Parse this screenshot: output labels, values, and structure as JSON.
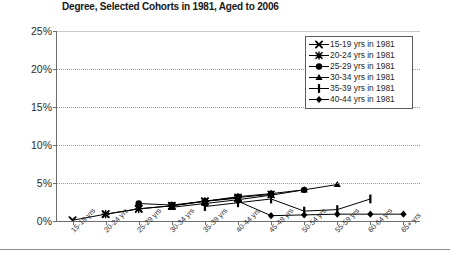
{
  "chart_data": {
    "type": "line",
    "title": "Degree, Selected Cohorts in 1981, Aged to 2006",
    "xlabel": "",
    "ylabel": "",
    "ylim": [
      0,
      25
    ],
    "yticks": [
      0,
      5,
      10,
      15,
      20,
      25
    ],
    "ytick_labels": [
      "0%",
      "5%",
      "10%",
      "15%",
      "20%",
      "25%"
    ],
    "grid": true,
    "legend_position": "top-right",
    "categories": [
      "15-19 yrs",
      "20-24 yrs",
      "25-29 yrs",
      "30-34 yrs",
      "35-39 yrs",
      "40-44 yrs",
      "45-49 yrs",
      "50-54 yrs",
      "55-59 yrs",
      "60-64 yrs",
      "65+ yrs"
    ],
    "series": [
      {
        "name": "15-19 yrs in 1981",
        "marker": "x",
        "color": "#000000",
        "x": [
          "15-19 yrs",
          "20-24 yrs",
          "25-29 yrs",
          "30-34 yrs",
          "35-39 yrs",
          "40-44 yrs"
        ],
        "values": [
          0.1,
          0.9,
          1.6,
          2.0,
          2.6,
          3.0
        ]
      },
      {
        "name": "20-24 yrs in 1981",
        "marker": "asterisk",
        "color": "#000000",
        "x": [
          "20-24 yrs",
          "25-29 yrs",
          "30-34 yrs",
          "35-39 yrs",
          "40-44 yrs",
          "45-49 yrs"
        ],
        "values": [
          0.9,
          1.6,
          2.0,
          2.6,
          3.1,
          3.5
        ]
      },
      {
        "name": "25-29 yrs in 1981",
        "marker": "circle",
        "color": "#000000",
        "x": [
          "25-29 yrs",
          "30-34 yrs",
          "35-39 yrs",
          "40-44 yrs",
          "45-49 yrs",
          "50-54 yrs"
        ],
        "values": [
          2.3,
          2.1,
          2.6,
          3.2,
          3.6,
          4.1
        ]
      },
      {
        "name": "30-34 yrs in 1981",
        "marker": "triangle",
        "color": "#000000",
        "x": [
          "30-34 yrs",
          "35-39 yrs",
          "40-44 yrs",
          "45-49 yrs",
          "50-54 yrs",
          "55-59 yrs"
        ],
        "values": [
          1.8,
          2.3,
          2.8,
          3.4,
          4.1,
          4.8
        ]
      },
      {
        "name": "35-39 yrs in 1981",
        "marker": "bar",
        "color": "#000000",
        "x": [
          "35-39 yrs",
          "40-44 yrs",
          "45-49 yrs",
          "50-54 yrs",
          "55-59 yrs",
          "60-64 yrs"
        ],
        "values": [
          1.9,
          2.4,
          2.9,
          1.3,
          1.5,
          2.9
        ]
      },
      {
        "name": "40-44 yrs in 1981",
        "marker": "diamond",
        "color": "#000000",
        "x": [
          "40-44 yrs",
          "45-49 yrs",
          "50-54 yrs",
          "55-59 yrs",
          "60-64 yrs",
          "65+ yrs"
        ],
        "values": [
          2.6,
          0.7,
          0.8,
          0.9,
          0.9,
          0.9
        ]
      }
    ]
  }
}
